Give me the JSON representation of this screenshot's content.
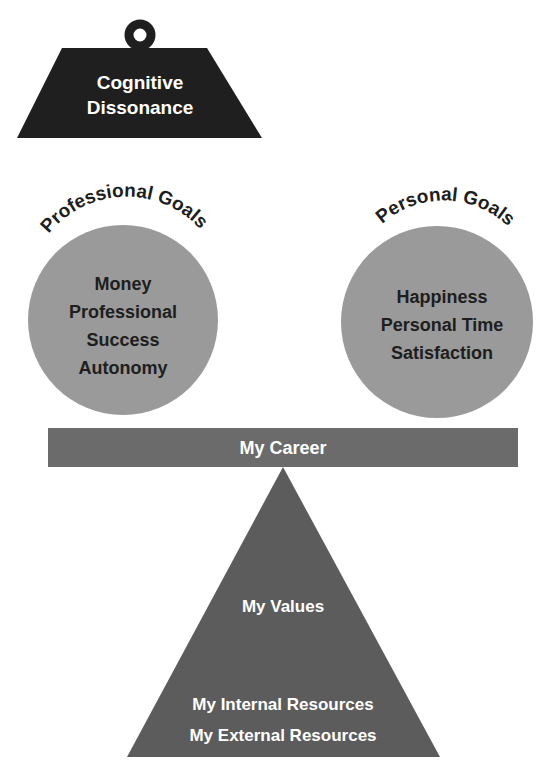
{
  "weight": {
    "lines": [
      "Cognitive",
      "Dissonance"
    ],
    "color": "#1f1f1f"
  },
  "left_goal": {
    "title": "Professional Goals",
    "items": [
      "Money",
      "Professional",
      "Success",
      "Autonomy"
    ],
    "color": "#9a9a9a"
  },
  "right_goal": {
    "title": "Personal Goals",
    "items": [
      "Happiness",
      "Personal Time",
      "Satisfaction"
    ],
    "color": "#9a9a9a"
  },
  "beam": {
    "label": "My Career",
    "color": "#6b6b6b"
  },
  "fulcrum": {
    "top_label": "My Values",
    "bottom_labels": [
      "My Internal Resources",
      "My External Resources"
    ],
    "color": "#5c5c5c"
  }
}
